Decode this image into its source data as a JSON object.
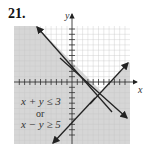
{
  "problem_number": "21.",
  "axis_labels": {
    "x": "x",
    "y": "y"
  },
  "inequalities": {
    "line1": "x + y ≤ 3",
    "connector": "or",
    "line2": "x − y ≥ 5"
  },
  "colors": {
    "shade": "#d4d4d4",
    "grid": "#e6e6e6",
    "line": "#222222"
  }
}
